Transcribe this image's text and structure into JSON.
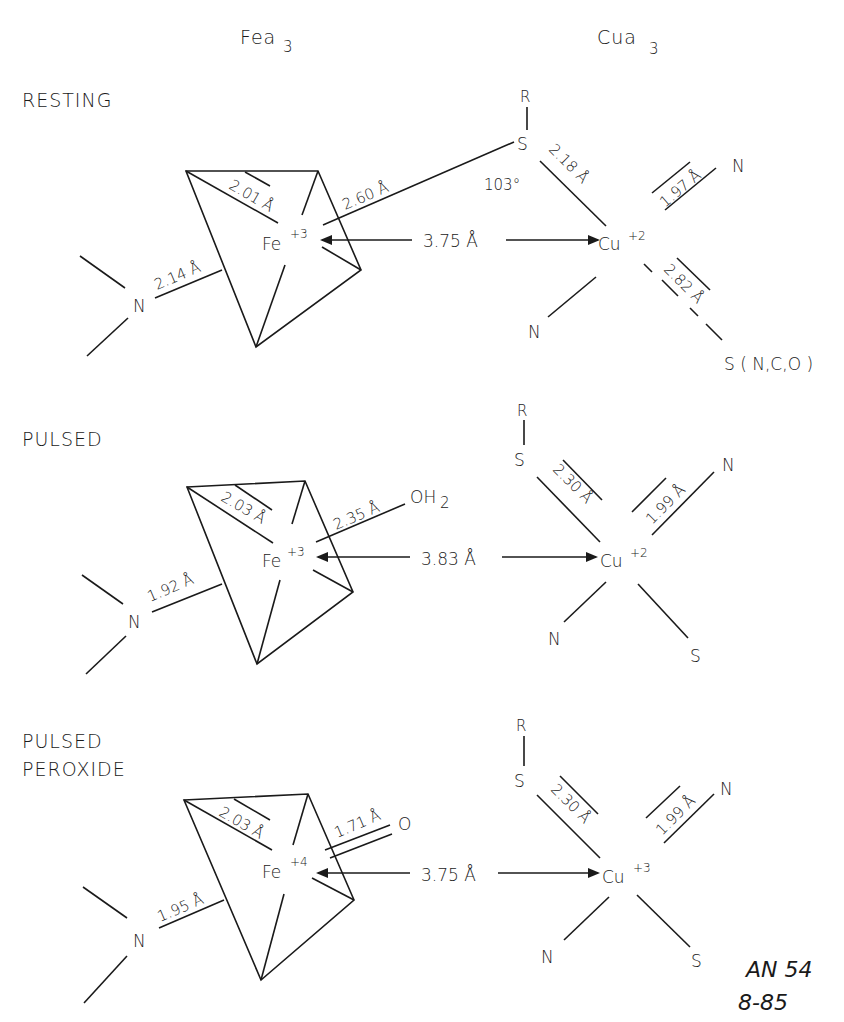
{
  "headers": {
    "fe": "Fea",
    "fe_sub": "3",
    "cu": "Cua",
    "cu_sub": "3"
  },
  "states": [
    {
      "name": "RESTING",
      "fe": {
        "label": "Fe",
        "charge": "+3",
        "n_bond": "2.14 Å",
        "eq_bond": "2.01 Å",
        "axial_bond": "2.60 Å",
        "axial_ligand": ""
      },
      "distance": "3.75 Å",
      "cu": {
        "label": "Cu",
        "charge": "+2",
        "s_bond": "2.18 Å",
        "n_bond": "1.97 Å",
        "long_bond": "2.82 Å",
        "long_ligand": "S ( N,C,O )",
        "angle": "103°"
      },
      "ligands": {
        "r": "R",
        "s": "S",
        "n_left": "N",
        "n_top": "N",
        "n_bottom": "N"
      }
    },
    {
      "name": "PULSED",
      "fe": {
        "label": "Fe",
        "charge": "+3",
        "n_bond": "1.92 Å",
        "eq_bond": "2.03 Å",
        "axial_bond": "2.35 Å",
        "axial_ligand": "OH",
        "axial_ligand_sub": "2"
      },
      "distance": "3.83 Å",
      "cu": {
        "label": "Cu",
        "charge": "+2",
        "s_bond": "2.30 Å",
        "n_bond": "1.99 Å",
        "bottom_s": "S"
      },
      "ligands": {
        "r": "R",
        "s": "S",
        "n_left": "N",
        "n_top": "N",
        "n_bottom": "N"
      }
    },
    {
      "name": "PULSED",
      "name2": "PEROXIDE",
      "fe": {
        "label": "Fe",
        "charge": "+4",
        "n_bond": "1.95 Å",
        "eq_bond": "2.03 Å",
        "axial_bond": "1.71 Å",
        "axial_ligand": "O"
      },
      "distance": "3.75 Å",
      "cu": {
        "label": "Cu",
        "charge": "+3",
        "s_bond": "2.30 Å",
        "n_bond": "1.99 Å",
        "bottom_s": "S"
      },
      "ligands": {
        "r": "R",
        "s": "S",
        "n_left": "N",
        "n_top": "N",
        "n_bottom": "N"
      }
    }
  ],
  "annotation": {
    "line1": "AN 54",
    "line2": "8-85"
  }
}
